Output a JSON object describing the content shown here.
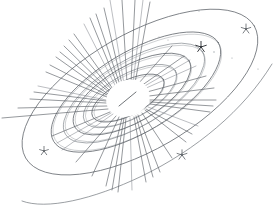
{
  "figure": {
    "medium": "pen-and-ink line sketch",
    "background_color": "#ffffff",
    "ink_color": "#555a60",
    "ink_color_dark": "#2f3338",
    "canvas": {
      "width": 277,
      "height": 219
    }
  },
  "core": {
    "label": "central star core",
    "center": {
      "x": 128,
      "y": 98
    },
    "radius_x": 22,
    "radius_y": 18,
    "fill": "#ffffff",
    "inner_tick": {
      "x1": 119,
      "y1": 106,
      "x2": 136,
      "y2": 92
    }
  },
  "rays": {
    "label": "radiating light rays",
    "count": 46,
    "origin": {
      "x": 128,
      "y": 98
    },
    "lines": [
      {
        "x1": 124,
        "y1": 84,
        "x2": 110,
        "y2": 0
      },
      {
        "x1": 127,
        "y1": 83,
        "x2": 122,
        "y2": 0
      },
      {
        "x1": 131,
        "y1": 83,
        "x2": 135,
        "y2": 0
      },
      {
        "x1": 135,
        "y1": 83,
        "x2": 150,
        "y2": 2
      },
      {
        "x1": 120,
        "y1": 85,
        "x2": 96,
        "y2": 14
      },
      {
        "x1": 116,
        "y1": 87,
        "x2": 84,
        "y2": 24
      },
      {
        "x1": 113,
        "y1": 89,
        "x2": 74,
        "y2": 34
      },
      {
        "x1": 110,
        "y1": 91,
        "x2": 64,
        "y2": 46
      },
      {
        "x1": 108,
        "y1": 94,
        "x2": 56,
        "y2": 57
      },
      {
        "x1": 107,
        "y1": 97,
        "x2": 46,
        "y2": 72
      },
      {
        "x1": 106,
        "y1": 100,
        "x2": 38,
        "y2": 86
      },
      {
        "x1": 106,
        "y1": 103,
        "x2": 30,
        "y2": 99
      },
      {
        "x1": 107,
        "y1": 106,
        "x2": 18,
        "y2": 108
      },
      {
        "x1": 108,
        "y1": 109,
        "x2": 2,
        "y2": 118
      },
      {
        "x1": 110,
        "y1": 112,
        "x2": 52,
        "y2": 136
      },
      {
        "x1": 113,
        "y1": 114,
        "x2": 62,
        "y2": 150
      },
      {
        "x1": 116,
        "y1": 116,
        "x2": 76,
        "y2": 162
      },
      {
        "x1": 119,
        "y1": 117,
        "x2": 92,
        "y2": 176
      },
      {
        "x1": 122,
        "y1": 118,
        "x2": 106,
        "y2": 186
      },
      {
        "x1": 126,
        "y1": 118,
        "x2": 118,
        "y2": 192
      },
      {
        "x1": 130,
        "y1": 118,
        "x2": 132,
        "y2": 190
      },
      {
        "x1": 134,
        "y1": 117,
        "x2": 146,
        "y2": 182
      },
      {
        "x1": 138,
        "y1": 115,
        "x2": 160,
        "y2": 172
      },
      {
        "x1": 142,
        "y1": 113,
        "x2": 172,
        "y2": 158
      },
      {
        "x1": 145,
        "y1": 110,
        "x2": 186,
        "y2": 142
      },
      {
        "x1": 148,
        "y1": 107,
        "x2": 198,
        "y2": 126
      },
      {
        "x1": 150,
        "y1": 104,
        "x2": 210,
        "y2": 112
      },
      {
        "x1": 150,
        "y1": 100,
        "x2": 216,
        "y2": 100
      },
      {
        "x1": 149,
        "y1": 96,
        "x2": 214,
        "y2": 88
      },
      {
        "x1": 147,
        "y1": 92,
        "x2": 206,
        "y2": 76
      },
      {
        "x1": 144,
        "y1": 89,
        "x2": 196,
        "y2": 66
      },
      {
        "x1": 141,
        "y1": 86,
        "x2": 184,
        "y2": 56
      },
      {
        "x1": 138,
        "y1": 84,
        "x2": 172,
        "y2": 46
      },
      {
        "x1": 118,
        "y1": 86,
        "x2": 90,
        "y2": 18
      },
      {
        "x1": 122,
        "y1": 84,
        "x2": 104,
        "y2": 8
      },
      {
        "x1": 133,
        "y1": 83,
        "x2": 143,
        "y2": 0
      },
      {
        "x1": 112,
        "y1": 90,
        "x2": 69,
        "y2": 40
      },
      {
        "x1": 109,
        "y1": 92,
        "x2": 60,
        "y2": 52
      },
      {
        "x1": 107,
        "y1": 95,
        "x2": 50,
        "y2": 65
      },
      {
        "x1": 106,
        "y1": 101,
        "x2": 34,
        "y2": 92
      },
      {
        "x1": 111,
        "y1": 113,
        "x2": 57,
        "y2": 143
      },
      {
        "x1": 124,
        "y1": 118,
        "x2": 112,
        "y2": 190
      },
      {
        "x1": 136,
        "y1": 116,
        "x2": 153,
        "y2": 177
      },
      {
        "x1": 146,
        "y1": 109,
        "x2": 192,
        "y2": 134
      },
      {
        "x1": 150,
        "y1": 102,
        "x2": 213,
        "y2": 106
      },
      {
        "x1": 143,
        "y1": 87,
        "x2": 190,
        "y2": 60
      }
    ]
  },
  "orbits": {
    "label": "elliptical orbit rings",
    "rings": [
      {
        "name": "ring-inner-1",
        "cx": 128,
        "cy": 98,
        "rx": 40,
        "ry": 17,
        "rotation": -28
      },
      {
        "name": "ring-inner-2",
        "cx": 130,
        "cy": 96,
        "rx": 52,
        "ry": 22,
        "rotation": -29
      },
      {
        "name": "ring-mid-1",
        "cx": 132,
        "cy": 94,
        "rx": 66,
        "ry": 28,
        "rotation": -30
      },
      {
        "name": "ring-mid-2",
        "cx": 134,
        "cy": 93,
        "rx": 80,
        "ry": 33,
        "rotation": -31
      },
      {
        "name": "ring-outer-1",
        "cx": 136,
        "cy": 92,
        "rx": 96,
        "ry": 40,
        "rotation": -31
      }
    ]
  },
  "outer_ellipse": {
    "label": "large outer disk boundary",
    "cx": 140,
    "cy": 92,
    "rx": 132,
    "ry": 58,
    "rotation": -30
  },
  "sweep_arc": {
    "label": "lower sweeping tail arc",
    "path": "M 22 201 C 46 210 92 200 142 176 C 196 150 244 110 272 64"
  },
  "star_markers": {
    "label": "small star glyphs",
    "items": [
      {
        "name": "star-upper-right",
        "x": 246,
        "y": 29,
        "size": 5.0,
        "dark": false
      },
      {
        "name": "star-ring-east",
        "x": 201,
        "y": 47,
        "size": 5.6,
        "dark": true
      },
      {
        "name": "star-lower-left",
        "x": 44,
        "y": 151,
        "size": 4.6,
        "dark": false
      },
      {
        "name": "star-lower-center",
        "x": 182,
        "y": 155,
        "size": 5.2,
        "dark": false
      }
    ]
  },
  "specks": {
    "label": "faint background specks",
    "items": [
      {
        "x": 214,
        "y": 52,
        "r": 0.7
      },
      {
        "x": 199,
        "y": 11,
        "r": 0.6
      },
      {
        "x": 232,
        "y": 58,
        "r": 0.6
      },
      {
        "x": 258,
        "y": 69,
        "r": 0.6
      },
      {
        "x": 168,
        "y": 40,
        "r": 0.5
      },
      {
        "x": 159,
        "y": 37,
        "r": 0.5
      }
    ]
  }
}
